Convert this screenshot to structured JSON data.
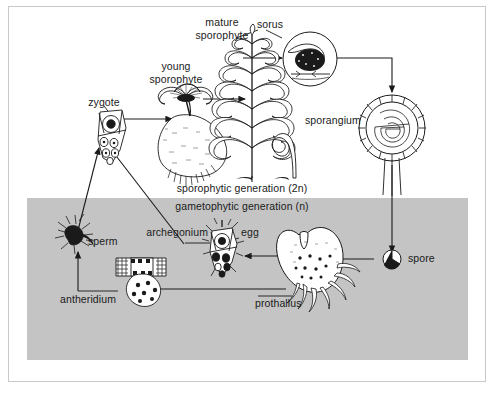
{
  "diagram": {
    "type": "biological-life-cycle-diagram",
    "colors": {
      "background": "#ffffff",
      "gametophyte_band": "#c4c4c4",
      "ink": "#1a1a1a",
      "frame": "#c9c9c9"
    },
    "generation_bands": [
      {
        "key": "sporophytic",
        "label": "sporophytic generation (2n)",
        "ploidy": "2n",
        "region": "upper-white"
      },
      {
        "key": "gametophytic",
        "label": "gametophytic generation (n)",
        "ploidy": "n",
        "region": "lower-gray"
      }
    ],
    "labels": {
      "mature_sporophyte_line1": "mature",
      "mature_sporophyte_line2": "sporophyte",
      "young_sporophyte_line1": "young",
      "young_sporophyte_line2": "sporophyte",
      "sorus": "sorus",
      "sporangium": "sporangium",
      "spore": "spore",
      "zygote": "zygote",
      "sperm": "sperm",
      "egg": "egg",
      "archegonium": "archegonium",
      "antheridium": "antheridium",
      "prothallus": "prothallus",
      "sporophytic_generation": "sporophytic generation (2n)",
      "gametophytic_generation": "gametophytic generation (n)"
    },
    "stages": [
      {
        "name": "zygote",
        "label": "zygote",
        "generation": "sporophytic"
      },
      {
        "name": "young-sporophyte",
        "label": "young sporophyte",
        "generation": "sporophytic"
      },
      {
        "name": "mature-sporophyte",
        "label": "mature sporophyte",
        "generation": "sporophytic"
      },
      {
        "name": "sorus",
        "label": "sorus",
        "generation": "sporophytic"
      },
      {
        "name": "sporangium",
        "label": "sporangium",
        "generation": "sporophytic"
      },
      {
        "name": "spore",
        "label": "spore",
        "generation": "gametophytic"
      },
      {
        "name": "prothallus",
        "label": "prothallus",
        "generation": "gametophytic"
      },
      {
        "name": "antheridium",
        "label": "antheridium",
        "generation": "gametophytic"
      },
      {
        "name": "sperm",
        "label": "sperm",
        "generation": "gametophytic"
      },
      {
        "name": "archegonium",
        "label": "archegonium",
        "generation": "gametophytic"
      },
      {
        "name": "egg",
        "label": "egg",
        "generation": "gametophytic"
      }
    ],
    "flow": [
      {
        "from": "zygote",
        "to": "young-sporophyte"
      },
      {
        "from": "young-sporophyte",
        "to": "mature-sporophyte"
      },
      {
        "from": "mature-sporophyte",
        "to": "sorus"
      },
      {
        "from": "sorus",
        "to": "sporangium"
      },
      {
        "from": "sporangium",
        "to": "spore"
      },
      {
        "from": "spore",
        "to": "prothallus"
      },
      {
        "from": "prothallus",
        "to": "antheridium"
      },
      {
        "from": "prothallus",
        "to": "archegonium"
      },
      {
        "from": "antheridium",
        "to": "sperm"
      },
      {
        "from": "sperm",
        "to": "zygote"
      },
      {
        "from": "archegonium",
        "to": "zygote"
      }
    ]
  }
}
